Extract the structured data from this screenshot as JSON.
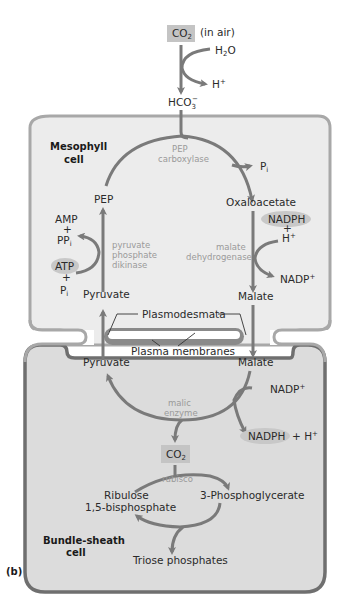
{
  "figure_label": "(b)",
  "colors": {
    "arrow": "#7a7a7a",
    "mesophyll_fill": "#ececec",
    "mesophyll_border": "#9c9c9c",
    "bundle_sheath_fill": "#dcdcdc",
    "bundle_sheath_border": "#6f6f6f",
    "highlight_box": "#c4c4c4",
    "highlight_ellipse": "#c8c8c8",
    "enzyme_text": "#9a9a9a"
  },
  "outside": {
    "co2": "CO",
    "co2_sub": "2",
    "co2_note": "(in air)",
    "h2o": "H",
    "h2o_sub": "2",
    "h2o_tail": "O",
    "h_plus": "H",
    "h_plus_sup": "+",
    "hco3": "HCO",
    "hco3_sub": "3",
    "hco3_sup": "−"
  },
  "mesophyll": {
    "cell_name_line1": "Mesophyll",
    "cell_name_line2": "cell",
    "enzyme_pep_carboxylase_1": "PEP",
    "enzyme_pep_carboxylase_2": "carboxylase",
    "pi": "P",
    "pi_sub": "i",
    "oxaloacetate": "Oxaloacetate",
    "nadph": "NADPH",
    "plus": "+",
    "h_plus": "H",
    "h_plus_sup": "+",
    "enzyme_malate_dh_1": "malate",
    "enzyme_malate_dh_2": "dehydrogenase",
    "nadp_plus": "NADP",
    "nadp_plus_sup": "+",
    "malate": "Malate",
    "pep": "PEP",
    "amp": "AMP",
    "ppi": "PP",
    "ppi_sub": "i",
    "atp": "ATP",
    "pi2": "P",
    "pi2_sub": "i",
    "enzyme_ppdk_1": "pyruvate",
    "enzyme_ppdk_2": "phosphate",
    "enzyme_ppdk_3": "dikinase",
    "pyruvate": "Pyruvate"
  },
  "junction": {
    "plasmodesmata": "Plasmodesmata",
    "plasma_membranes": "Plasma membranes"
  },
  "bundle_sheath": {
    "cell_name_line1": "Bundle-sheath",
    "cell_name_line2": "cell",
    "pyruvate": "Pyruvate",
    "malate": "Malate",
    "nadp_plus": "NADP",
    "nadp_plus_sup": "+",
    "enzyme_malic_1": "malic",
    "enzyme_malic_2": "enzyme",
    "nadph": "NADPH",
    "nadph_tail": "+ H",
    "nadph_tail_sup": "+",
    "co2": "CO",
    "co2_sub": "2",
    "enzyme_rubisco": "rubisco",
    "ribulose_1": "Ribulose",
    "ribulose_2": "1,5-bisphosphate",
    "pga": "3-Phosphoglycerate",
    "triose": "Triose phosphates"
  }
}
